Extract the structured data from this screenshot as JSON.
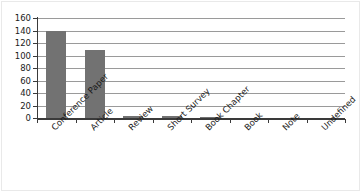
{
  "chart_data": {
    "type": "bar",
    "title": "",
    "subtitle": "",
    "xlabel": "",
    "ylabel": "",
    "categories": [
      "Conference Paper",
      "Article",
      "Review",
      "Short Survey",
      "Book Chapter",
      "Book",
      "Note",
      "Undefined"
    ],
    "values": [
      140,
      109,
      4,
      3,
      1,
      0,
      0,
      0
    ],
    "ylim": [
      0,
      160
    ],
    "ytick_labels": [
      "0",
      "20",
      "40",
      "60",
      "80",
      "100",
      "120",
      "140",
      "160"
    ],
    "ytick_values": [
      0,
      20,
      40,
      60,
      80,
      100,
      120,
      140,
      160
    ],
    "grid": "horizontal",
    "legend": "none",
    "bar_color": "#727272",
    "gridline_color": "#9a9a9a",
    "axis_color": "#3a3a3a",
    "background_color": "#ffffff",
    "xtick_label_rotation": -45
  }
}
